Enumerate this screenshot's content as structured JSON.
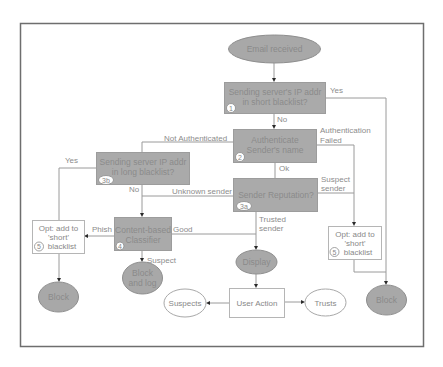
{
  "diagram": {
    "nodes": {
      "start": {
        "label": "Email received",
        "shape": "ellipse",
        "fill": "gray"
      },
      "step1": {
        "lines": [
          "Sending server's IP addr",
          "in  short  blacklist?"
        ],
        "badge": "1",
        "shape": "box",
        "fill": "gray"
      },
      "step2": {
        "lines": [
          "Authenticate",
          "Sender's name"
        ],
        "badge": "2",
        "shape": "box",
        "fill": "gray"
      },
      "step3b": {
        "lines": [
          "Sending server IP addr",
          "in  long  blacklist?"
        ],
        "badge": "3b",
        "shape": "box",
        "fill": "gray"
      },
      "step3a": {
        "label": "Sender Reputation?",
        "badge": "3a",
        "shape": "box",
        "fill": "gray"
      },
      "step4": {
        "lines": [
          "Content-based",
          "Classifier"
        ],
        "badge": "4",
        "shape": "box",
        "fill": "gray"
      },
      "opt_left": {
        "lines": [
          "Opt: add to",
          "'short'",
          "blacklist"
        ],
        "badge": "5",
        "shape": "box",
        "fill": "white"
      },
      "opt_right": {
        "lines": [
          "Opt: add to",
          "'short'",
          "blacklist"
        ],
        "badge": "5",
        "shape": "box",
        "fill": "white"
      },
      "block_left": {
        "label": "Block",
        "shape": "ellipse",
        "fill": "gray"
      },
      "block_log": {
        "lines": [
          "Block",
          "and log"
        ],
        "shape": "ellipse",
        "fill": "gray"
      },
      "display": {
        "label": "Display",
        "shape": "ellipse",
        "fill": "gray"
      },
      "block_right": {
        "label": "Block",
        "shape": "ellipse",
        "fill": "gray"
      },
      "user_action": {
        "label": "User Action",
        "shape": "box",
        "fill": "white"
      },
      "suspects": {
        "label": "Suspects",
        "shape": "ellipse",
        "fill": "white"
      },
      "trusts": {
        "label": "Trusts",
        "shape": "ellipse",
        "fill": "white"
      }
    },
    "edge_labels": {
      "yes_1": "Yes",
      "no_1": "No",
      "not_authenticated": "Not Authenticated",
      "auth_failed": [
        "Authentication",
        "Failed"
      ],
      "ok": "Ok",
      "yes_3b": "Yes",
      "no_3b": "No",
      "unknown_sender": "Unknown sender",
      "suspect_sender": [
        "Suspect",
        "sender"
      ],
      "trusted_sender": [
        "Trusted",
        "sender"
      ],
      "phish": "Phish",
      "good": "Good",
      "suspect": "Suspect"
    },
    "edges": [
      [
        "start",
        "step1"
      ],
      [
        "step1",
        "block_right",
        "yes_1"
      ],
      [
        "step1",
        "step2",
        "no_1"
      ],
      [
        "step2",
        "step3b",
        "not_authenticated"
      ],
      [
        "step2",
        "opt_right",
        "auth_failed"
      ],
      [
        "step2",
        "step3a",
        "ok"
      ],
      [
        "step3b",
        "opt_left",
        "yes_3b"
      ],
      [
        "step3b",
        "step4",
        "no_3b"
      ],
      [
        "step3a",
        "step4",
        "unknown_sender"
      ],
      [
        "step3a",
        "opt_right",
        "suspect_sender"
      ],
      [
        "step3a",
        "display",
        "trusted_sender"
      ],
      [
        "step4",
        "opt_left",
        "phish"
      ],
      [
        "step4",
        "display",
        "good"
      ],
      [
        "step4",
        "block_log",
        "suspect"
      ],
      [
        "opt_left",
        "block_left"
      ],
      [
        "opt_right",
        "block_right"
      ],
      [
        "display",
        "user_action"
      ],
      [
        "user_action",
        "suspects"
      ],
      [
        "user_action",
        "trusts"
      ]
    ]
  }
}
